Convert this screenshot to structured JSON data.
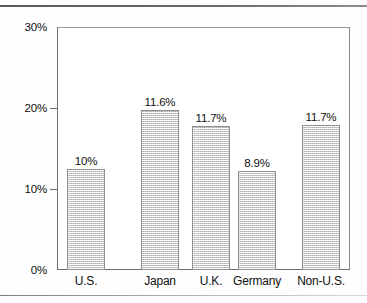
{
  "chart_data": {
    "type": "bar",
    "title": "",
    "subtitle": "",
    "xlabel": "",
    "ylabel": "",
    "ylim": [
      0,
      30
    ],
    "y_ticks": [
      "0%",
      "10%",
      "20%",
      "30%"
    ],
    "y_tick_values": [
      0,
      10,
      20,
      30
    ],
    "grid": false,
    "legend": null,
    "categories": [
      "U.S.",
      "Japan",
      "U.K.",
      "Germany",
      "Non-U.S."
    ],
    "values": [
      12.5,
      19.7,
      17.8,
      12.2,
      17.9
    ],
    "data_labels": [
      "10%",
      "11.6%",
      "11.7%",
      "8.9%",
      "11.7%"
    ],
    "series": [
      {
        "name": "",
        "values": [
          12.5,
          19.7,
          17.8,
          12.2,
          17.9
        ],
        "labels": [
          "10%",
          "11.6%",
          "11.7%",
          "8.9%",
          "11.7%"
        ]
      }
    ],
    "bars": [
      {
        "category": "U.S.",
        "value": 12.5,
        "label": "10%"
      },
      {
        "category": "Japan",
        "value": 19.7,
        "label": "11.6%"
      },
      {
        "category": "U.K.",
        "value": 17.8,
        "label": "11.7%"
      },
      {
        "category": "Germany",
        "value": 12.2,
        "label": "8.9%"
      },
      {
        "category": "Non-U.S.",
        "value": 17.9,
        "label": "11.7%"
      }
    ],
    "colors": {
      "bar_fill": "#ececec",
      "bar_border": "#909090",
      "axis": "#6e6e6e",
      "text": "#0f0f0f",
      "background": "#ffffff"
    }
  }
}
